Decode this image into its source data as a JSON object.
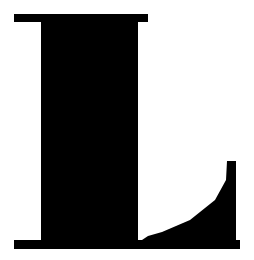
{
  "image": {
    "kind": "glyph-artwork",
    "subject": "letter-L",
    "character": "L",
    "script": "Latin",
    "case": "uppercase",
    "style": "serif",
    "width": 254,
    "height": 260,
    "alt_text": "L"
  },
  "colors": {
    "background": "#ffffff",
    "glyph": "#000000"
  },
  "geometry": {
    "top_serif": {
      "x_start": 14,
      "x_end": 148,
      "y_start": 14,
      "y_end": 22
    },
    "stem": {
      "x_start": 41,
      "x_end": 138,
      "y_start": 14,
      "y_end": 249
    },
    "bottom_serif": {
      "x_start": 14,
      "x_end": 240,
      "y_start": 240,
      "y_end": 249
    },
    "tail_terminal": {
      "x_start": 227,
      "x_end": 236,
      "y_start": 161
    },
    "curve_points": [
      [
        227,
        161
      ],
      [
        226,
        180
      ],
      [
        215,
        200
      ],
      [
        190,
        220
      ],
      [
        162,
        232
      ],
      [
        148,
        236
      ],
      [
        142,
        240
      ]
    ],
    "outline_path": "M 14 14 L 148 14 L 148 22 L 138 22 L 138 240 L 240 240 L 240 249 L 14 249 L 14 240 L 41 240 L 41 22 L 14 22 Z",
    "glyph_path": "M 14.5 14 L 148 14 L 148 22 L 137.5 22 L 137.5 240 L 14.5 240 Z M 236 161 L 236 249 L 14 249 L 14 240 L 41 240 L 41 22 L 14 22 L 14 14 Z"
  }
}
